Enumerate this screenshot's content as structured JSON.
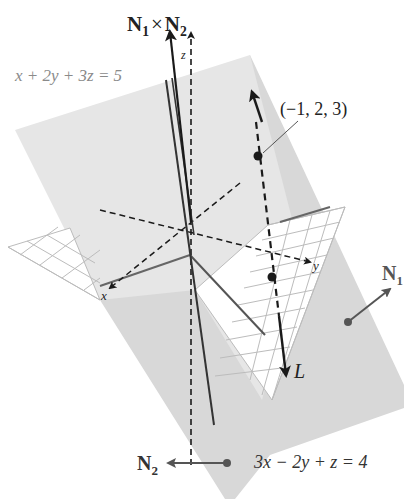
{
  "figure": {
    "planes": [
      {
        "id": "plane1",
        "equation": "x + 2y + 3z = 5",
        "normal_label": "N",
        "normal_sub": "1",
        "fill": "#e4e4e4"
      },
      {
        "id": "plane2",
        "equation": "3x − 2y + z = 4",
        "normal_label": "N",
        "normal_sub": "2",
        "fill": "#d6d6d6"
      }
    ],
    "cross_product_label": {
      "a": "N",
      "a_sub": "1",
      "op": "×",
      "b": "N",
      "b_sub": "2"
    },
    "point_label": "(−1, 2, 3)",
    "line_label": "L",
    "axes": {
      "x": "x",
      "y": "y",
      "z": "z"
    },
    "colors": {
      "plane_light": "#e6e6e6",
      "plane_dark": "#d4d4d4",
      "grid": "#bdbdbd",
      "line": "#1a1a1a",
      "normal_arrow": "#555555",
      "equation_gray": "#8a8a8a"
    }
  }
}
